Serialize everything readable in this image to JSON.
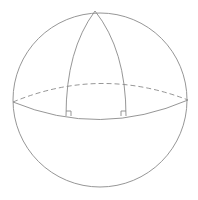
{
  "diagram": {
    "type": "spherical-triangle-on-sphere",
    "colors": {
      "line": "#8a8a8a",
      "background": "#ffffff"
    },
    "sphere": {
      "cx": 100,
      "cy": 100,
      "r": 87
    },
    "apex": {
      "x": 95,
      "y": 11
    },
    "equator": {
      "left": {
        "x": 13,
        "y": 102
      },
      "right": {
        "x": 188,
        "y": 100
      },
      "back_control_y": 66,
      "front_control_y": 138
    },
    "meridians": [
      {
        "name": "left",
        "foot": {
          "x": 66,
          "y": 116
        }
      },
      {
        "name": "right",
        "foot": {
          "x": 126,
          "y": 116
        }
      }
    ],
    "right_angle_markers": [
      {
        "at": "left-foot",
        "size": 5
      },
      {
        "at": "right-foot",
        "size": 5
      }
    ],
    "labels": []
  }
}
